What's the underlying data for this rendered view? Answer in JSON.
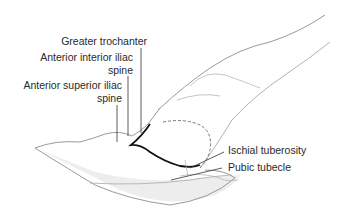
{
  "figure": {
    "labels": {
      "greater_trochanter": "Greater trochanter",
      "anterior_inferior_iliac_spine_line1": "Anterior interior iliac",
      "anterior_inferior_iliac_spine_line2": "spine",
      "anterior_superior_iliac_spine_line1": "Anterior superior iliac",
      "anterior_superior_iliac_spine_line2": "spine",
      "ischial_tuberosity": "Ischial tuberosity",
      "pubic_tubercle": "Pubic tubecle"
    },
    "colors": {
      "outline": "#9a9a9a",
      "bold_curve": "#111111",
      "leader_line": "#333333",
      "shading": "#cfcfcf"
    }
  }
}
